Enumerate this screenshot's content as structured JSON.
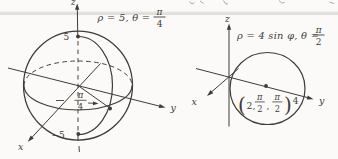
{
  "colors": {
    "ink": "#3e3c38",
    "rule": "#c8c5bf",
    "background": "#fbfaf8"
  },
  "sphere_figure": {
    "equation": {
      "prefix": "ρ = 5, θ =",
      "fraction_numerator": "π",
      "fraction_denominator": "4"
    },
    "axes": {
      "x": "x",
      "y": "y",
      "z": "z"
    },
    "z_ticks": {
      "top": "5",
      "bottom": "−5"
    },
    "angle_label": {
      "fraction_numerator": "π",
      "fraction_denominator": "4"
    }
  },
  "circle_figure": {
    "equation": {
      "prefix": "ρ = 4 sin φ, θ =",
      "fraction_numerator": "π",
      "fraction_denominator": "2"
    },
    "axes": {
      "x": "x",
      "y": "y",
      "z": "z"
    },
    "y_tick": "4",
    "center_point_label": {
      "open_paren": "(",
      "rho": "2,",
      "frac1_numerator": "π",
      "frac1_denominator": "2",
      "separator": ",",
      "frac2_numerator": "π",
      "frac2_denominator": "2",
      "close_paren": ")"
    }
  }
}
